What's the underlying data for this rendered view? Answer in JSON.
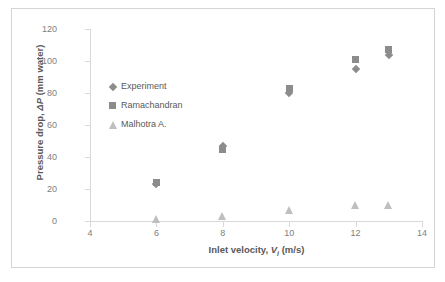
{
  "chart_data": {
    "type": "scatter",
    "title": "",
    "xlabel": "Inlet velocity, V_i (m/s)",
    "xlabel_parts": {
      "pre": "Inlet velocity, ",
      "italic": "V",
      "sub": "i",
      "post": " (m/s)"
    },
    "ylabel": "Pressure drop, ΔP (mm water)",
    "ylabel_parts": {
      "pre": "Pressure drop, ",
      "delta": "Δ",
      "italic": "P",
      "post": " (mm water)"
    },
    "xlim": [
      4,
      14
    ],
    "ylim": [
      0,
      120
    ],
    "xticks": [
      "4",
      "6",
      "8",
      "10",
      "12",
      "14"
    ],
    "xtick_values": [
      4,
      6,
      8,
      10,
      12,
      14
    ],
    "yticks": [
      "0",
      "20",
      "40",
      "60",
      "80",
      "100",
      "120"
    ],
    "ytick_values": [
      0,
      20,
      40,
      60,
      80,
      100,
      120
    ],
    "grid": false,
    "legend_position": "inside-upper-left",
    "x": [
      6,
      8,
      10,
      12,
      13
    ],
    "series": [
      {
        "name": "Experiment",
        "marker": "diamond",
        "color": "#8c8c8c",
        "values": [
          23,
          47,
          80,
          95,
          104
        ]
      },
      {
        "name": "Ramachandran",
        "marker": "square",
        "color": "#8c8c8c",
        "values": [
          24,
          45,
          83,
          101,
          107
        ]
      },
      {
        "name": "Malhotra A.",
        "marker": "triangle",
        "color": "#bfbfbf",
        "values": [
          1,
          3,
          7,
          10,
          10
        ]
      }
    ]
  },
  "legend": {
    "entries": [
      {
        "label": "Experiment",
        "marker": "diamond"
      },
      {
        "label": "Ramachandran",
        "marker": "square"
      },
      {
        "label": "Malhotra A.",
        "marker": "triangle"
      }
    ]
  },
  "colors": {
    "marker_dark": "#8c8c8c",
    "marker_light": "#bfbfbf",
    "axis": "#d9d9d9",
    "text": "#595959",
    "tick_text": "#808080",
    "frame": "#d4d4d4",
    "background": "#ffffff"
  }
}
